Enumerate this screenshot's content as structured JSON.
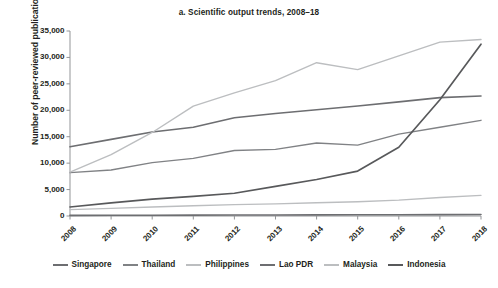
{
  "chart_data": {
    "type": "line",
    "title": "a. Scientific output trends, 2008–18",
    "xlabel": "",
    "ylabel": "Number of peer-reviewed publications",
    "x": [
      "2008",
      "2009",
      "2010",
      "2011",
      "2012",
      "2013",
      "2014",
      "2015",
      "2016",
      "2017",
      "2018"
    ],
    "categories": [
      "2008",
      "2009",
      "2010",
      "2011",
      "2012",
      "2013",
      "2014",
      "2015",
      "2016",
      "2017",
      "2018"
    ],
    "ylim": [
      0,
      35000
    ],
    "ytick_values": [
      0,
      5000,
      10000,
      15000,
      20000,
      25000,
      30000,
      35000
    ],
    "ytick_labels": [
      "0",
      "5,000",
      "10,000",
      "15,000",
      "20,000",
      "25,000",
      "30,000",
      "35,000"
    ],
    "grid": false,
    "legend_position": "bottom",
    "series": [
      {
        "name": "Singapore",
        "color": "#6d6e71",
        "values": [
          13100,
          14500,
          15900,
          16800,
          18600,
          19400,
          20100,
          20800,
          21600,
          22400,
          22700
        ]
      },
      {
        "name": "Thailand",
        "color": "#808285",
        "values": [
          8200,
          8700,
          10100,
          10900,
          12400,
          12600,
          13800,
          13400,
          15500,
          16800,
          18100
        ]
      },
      {
        "name": "Philippines",
        "color": "#bcbec0",
        "values": [
          1200,
          1450,
          1700,
          1950,
          2150,
          2300,
          2500,
          2700,
          3000,
          3500,
          3900
        ]
      },
      {
        "name": "Lao PDR",
        "color": "#6d6e71",
        "values": [
          120,
          135,
          150,
          165,
          180,
          195,
          210,
          225,
          240,
          255,
          270
        ]
      },
      {
        "name": "Malaysia",
        "color": "#bcbec0",
        "values": [
          8300,
          11600,
          15800,
          20800,
          23300,
          25600,
          29000,
          27700,
          30300,
          32900,
          33400
        ]
      },
      {
        "name": "Indonesia",
        "color": "#58595b",
        "values": [
          1700,
          2500,
          3200,
          3700,
          4300,
          5600,
          6900,
          8500,
          13000,
          22000,
          32500
        ]
      }
    ]
  },
  "axis": {
    "y_label": "Number of peer-reviewed publications"
  },
  "legend": {
    "items": [
      {
        "label": "Singapore",
        "color": "#6d6e71"
      },
      {
        "label": "Thailand",
        "color": "#808285"
      },
      {
        "label": "Philippines",
        "color": "#bcbec0"
      },
      {
        "label": "Lao PDR",
        "color": "#6d6e71"
      },
      {
        "label": "Malaysia",
        "color": "#bcbec0"
      },
      {
        "label": "Indonesia",
        "color": "#58595b"
      }
    ]
  }
}
